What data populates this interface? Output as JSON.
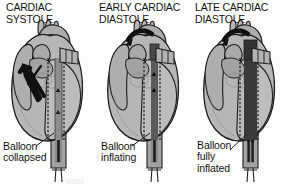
{
  "figure": {
    "title_text": "Intra-aortic balloon pump across the cardiac cycle",
    "background_color": "#fdfdfd",
    "ink_color": "#151515",
    "style": "grayscale line-and-tone medical illustration"
  },
  "panels": [
    {
      "id": "cardiac-systole",
      "title": "CARDIAC\nSYSTOLE",
      "caption": "Balloon\ncollapsed",
      "balloon_state": "collapsed",
      "balloon_fill": "#8d8d8d",
      "arrow": {
        "kind": "straight-thick-arrow",
        "description": "black arrow from left ventricle up through aortic valve",
        "direction": "up-left"
      }
    },
    {
      "id": "early-cardiac-diastole",
      "title": "EARLY CARDIAC\nDIASTOLE",
      "caption": "Balloon\ninflating",
      "balloon_state": "inflating",
      "balloon_fill": "#5a5a5a",
      "arrow": {
        "kind": "curved-thick-arrow",
        "description": "black curved arrow over aortic arch toward head vessels",
        "direction": "left-along-arch"
      }
    },
    {
      "id": "late-cardiac-diastole",
      "title": "LATE CARDIAC\nDIASTOLE",
      "caption": "Balloon\nfully\ninflated",
      "balloon_state": "fully inflated",
      "balloon_fill": "#3a3a3a",
      "arrow": {
        "kind": "curved-thick-arrow",
        "description": "black curved arrow over aortic arch toward head vessels",
        "direction": "left-along-arch"
      }
    }
  ],
  "colors": {
    "heart_body": "#b4b4b4",
    "heart_body_dark": "#9d9d9d",
    "heart_body_light": "#c4c4c4",
    "atrium": "#aaaaaa",
    "vessel": "#b0b0b0",
    "outline": "#1d1d1d",
    "catheter_sheath": "#9a9a9a",
    "catheter_core": "#2a2a2a",
    "text": "#151515"
  },
  "labels": {
    "leader_line": "leader line from caption to balloon"
  }
}
